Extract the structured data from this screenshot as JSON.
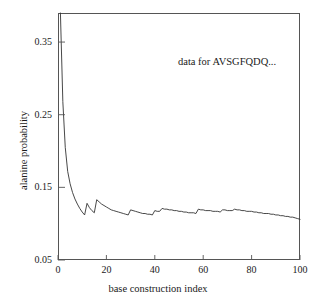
{
  "chart_data": {
    "type": "line",
    "title": "",
    "xlabel": "base construction index",
    "ylabel": "alanine probability",
    "xlim": [
      0,
      100
    ],
    "ylim": [
      0.05,
      0.39
    ],
    "xticks": [
      0,
      20,
      40,
      60,
      80,
      100
    ],
    "xtick_labels": [
      "0",
      "20",
      "40",
      "60",
      "80",
      "100"
    ],
    "yticks": [
      0.05,
      0.15,
      0.25,
      0.35
    ],
    "ytick_labels": [
      "0.05",
      "0.15",
      "0.25",
      "0.35"
    ],
    "grid": false,
    "legend": false,
    "annotations": [
      {
        "text": "data for AVSGFQDQ...",
        "x": 58,
        "y": 0.325
      }
    ],
    "series": [
      {
        "name": "alanine probability",
        "color": "#333333",
        "x": [
          1,
          2,
          3,
          4,
          5,
          6,
          7,
          8,
          9,
          10,
          11,
          12,
          13,
          14,
          15,
          16,
          17,
          18,
          19,
          20,
          21,
          22,
          23,
          24,
          25,
          26,
          27,
          28,
          29,
          30,
          31,
          32,
          33,
          34,
          35,
          36,
          37,
          38,
          39,
          40,
          41,
          42,
          43,
          44,
          45,
          46,
          47,
          48,
          49,
          50,
          51,
          52,
          53,
          54,
          55,
          56,
          57,
          58,
          59,
          60,
          61,
          62,
          63,
          64,
          65,
          66,
          67,
          68,
          69,
          70,
          71,
          72,
          73,
          74,
          75,
          76,
          77,
          78,
          79,
          80,
          81,
          82,
          83,
          84,
          85,
          86,
          87,
          88,
          89,
          90,
          91,
          92,
          93,
          94,
          95,
          96,
          97,
          98,
          99,
          100
        ],
        "y": [
          0.39,
          0.268,
          0.205,
          0.172,
          0.155,
          0.143,
          0.134,
          0.127,
          0.121,
          0.116,
          0.112,
          0.128,
          0.122,
          0.118,
          0.115,
          0.133,
          0.13,
          0.127,
          0.125,
          0.123,
          0.121,
          0.119,
          0.118,
          0.117,
          0.116,
          0.115,
          0.114,
          0.113,
          0.112,
          0.119,
          0.118,
          0.117,
          0.116,
          0.115,
          0.114,
          0.114,
          0.113,
          0.113,
          0.112,
          0.118,
          0.117,
          0.117,
          0.121,
          0.12,
          0.12,
          0.119,
          0.119,
          0.118,
          0.118,
          0.117,
          0.117,
          0.116,
          0.116,
          0.115,
          0.115,
          0.115,
          0.114,
          0.12,
          0.119,
          0.119,
          0.118,
          0.118,
          0.118,
          0.117,
          0.117,
          0.117,
          0.116,
          0.119,
          0.119,
          0.118,
          0.118,
          0.118,
          0.12,
          0.119,
          0.119,
          0.118,
          0.118,
          0.117,
          0.117,
          0.117,
          0.116,
          0.116,
          0.115,
          0.115,
          0.114,
          0.114,
          0.114,
          0.113,
          0.113,
          0.112,
          0.112,
          0.111,
          0.111,
          0.11,
          0.11,
          0.109,
          0.109,
          0.108,
          0.107,
          0.106
        ]
      }
    ]
  },
  "axes": {
    "x_title": "base construction index",
    "y_title": "alanine probability"
  }
}
